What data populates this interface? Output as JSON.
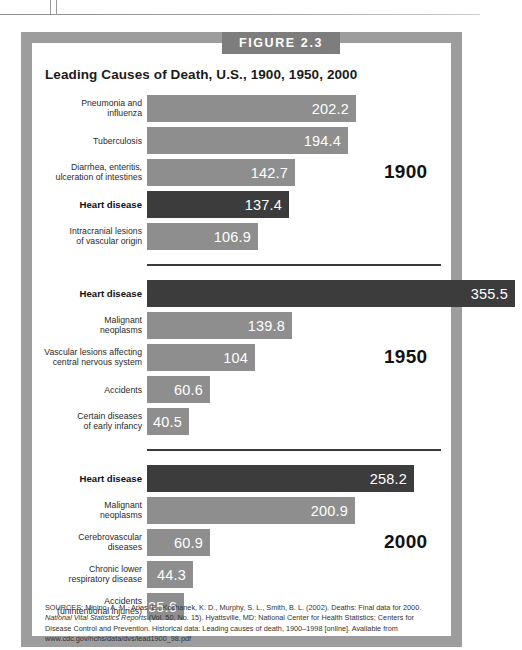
{
  "figure": {
    "tab_label": "FIGURE 2.3",
    "title": "Leading Causes of Death, U.S., 1900, 1950, 2000"
  },
  "sources": {
    "line1_prefix": "SOURCES: Minino, A. M., Arias, E., Kochanek, K. D., Murphy, S. L., Smith, B. L. (2002). Deaths: Final data for 2000. ",
    "line1_italic": "National Vital Statistics Reports",
    "line1_suffix": " (Vol. 50, No. 15). Hyattsville, MD: National Center for Health Statistics; Centers for Disease Control and Prevention. Historical data: Leading causes of death, 1900–1998 [online]. Available from www.cdc.gov/nchs/data/dvs/lead1900_98.pdf"
  },
  "chart_data": {
    "type": "bar",
    "title": "Leading Causes of Death, U.S., 1900, 1950, 2000",
    "xlabel": "",
    "ylabel": "",
    "orientation": "horizontal",
    "value_unit": "deaths per 100,000 population",
    "xlim": [
      0,
      355.5
    ],
    "grid": false,
    "legend": "none",
    "colors": {
      "bar": "#8e8e8e",
      "highlight_bar": "#3c3c3c",
      "frame": "#9d9d9d",
      "tab": "#7d7d7d"
    },
    "groups": [
      {
        "year": "1900",
        "items": [
          {
            "label_line1": "Pneumonia and",
            "label_line2": "influenza",
            "value": 202.2,
            "display": "202.2",
            "highlight": false
          },
          {
            "label_line1": "Tuberculosis",
            "label_line2": "",
            "value": 194.4,
            "display": "194.4",
            "highlight": false
          },
          {
            "label_line1": "Diarrhea, enteritis,",
            "label_line2": "ulceration of intestines",
            "value": 142.7,
            "display": "142.7",
            "highlight": false
          },
          {
            "label_line1": "Heart disease",
            "label_line2": "",
            "value": 137.4,
            "display": "137.4",
            "highlight": true
          },
          {
            "label_line1": "Intracranial lesions",
            "label_line2": "of vascular origin",
            "value": 106.9,
            "display": "106.9",
            "highlight": false
          }
        ]
      },
      {
        "year": "1950",
        "items": [
          {
            "label_line1": "Heart disease",
            "label_line2": "",
            "value": 355.5,
            "display": "355.5",
            "highlight": true
          },
          {
            "label_line1": "Malignant",
            "label_line2": "neoplasms",
            "value": 139.8,
            "display": "139.8",
            "highlight": false
          },
          {
            "label_line1": "Vascular lesions affecting",
            "label_line2": "central nervous system",
            "value": 104,
            "display": "104",
            "highlight": false
          },
          {
            "label_line1": "Accidents",
            "label_line2": "",
            "value": 60.6,
            "display": "60.6",
            "highlight": false
          },
          {
            "label_line1": "Certain diseases",
            "label_line2": "of early infancy",
            "value": 40.5,
            "display": "40.5",
            "highlight": false
          }
        ]
      },
      {
        "year": "2000",
        "items": [
          {
            "label_line1": "Heart disease",
            "label_line2": "",
            "value": 258.2,
            "display": "258.2",
            "highlight": true
          },
          {
            "label_line1": "Malignant",
            "label_line2": "neoplasms",
            "value": 200.9,
            "display": "200.9",
            "highlight": false
          },
          {
            "label_line1": "Cerebrovascular",
            "label_line2": "diseases",
            "value": 60.9,
            "display": "60.9",
            "highlight": false
          },
          {
            "label_line1": "Chronic lower",
            "label_line2": "respiratory disease",
            "value": 44.3,
            "display": "44.3",
            "highlight": false
          },
          {
            "label_line1": "Accidents",
            "label_line2": "(unintentional injuries)",
            "value": 35.6,
            "display": "35.6",
            "highlight": false
          }
        ]
      }
    ]
  }
}
